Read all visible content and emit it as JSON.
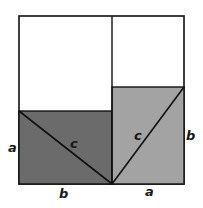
{
  "diagram": {
    "colors": {
      "background": "#ffffff",
      "left_triangle_region": "#6b6b6b",
      "right_triangle_region": "#a3a3a3",
      "stroke": "#111111",
      "square_fill": "#ffffff"
    },
    "labels": {
      "left_side": "a",
      "left_hypotenuse": "c",
      "bottom_left": "b",
      "right_hypotenuse": "c",
      "right_side": "b",
      "bottom_right": "a"
    }
  }
}
